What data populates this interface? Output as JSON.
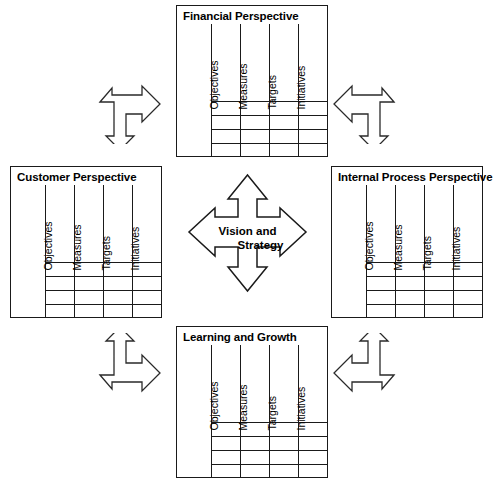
{
  "diagram": {
    "center": {
      "name": "vision-and-strategy",
      "line1": "Vision and",
      "line2": "Strategy"
    },
    "column_headers": [
      "Objectives",
      "Measures",
      "Targets",
      "Initiatives"
    ],
    "row_count": 4,
    "panels": [
      {
        "id": "financial",
        "title": "Financial Perspective"
      },
      {
        "id": "customer",
        "title": "Customer Perspective"
      },
      {
        "id": "internal",
        "title": "Internal Process Perspective"
      },
      {
        "id": "learning",
        "title": "Learning and Growth"
      }
    ],
    "connectors": [
      {
        "id": "top-left",
        "icon": "bent-arrow-right-down-icon"
      },
      {
        "id": "top-right",
        "icon": "bent-arrow-left-down-icon"
      },
      {
        "id": "bottom-left",
        "icon": "bent-arrow-up-right-icon"
      },
      {
        "id": "bottom-right",
        "icon": "bent-arrow-up-left-icon"
      }
    ],
    "colors": {
      "stroke": "#1a1a1a",
      "background": "#ffffff"
    }
  }
}
